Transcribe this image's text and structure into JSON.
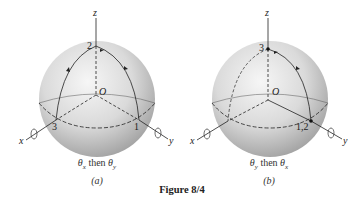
{
  "figure": {
    "title": "Figure 8/4",
    "panels": [
      {
        "id": "a",
        "tag": "(a)",
        "caption": "θx then θy",
        "caption_parts": {
          "t1": "θ",
          "s1": "x",
          "mid": " then ",
          "t2": "θ",
          "s2": "y"
        },
        "axes": {
          "x": "x",
          "y": "y",
          "z": "z"
        },
        "origin": "O",
        "points": {
          "top": "2",
          "left": "3",
          "right": "1"
        }
      },
      {
        "id": "b",
        "tag": "(b)",
        "caption": "θy then θx",
        "caption_parts": {
          "t1": "θ",
          "s1": "y",
          "mid": " then ",
          "t2": "θ",
          "s2": "x"
        },
        "axes": {
          "x": "x",
          "y": "y",
          "z": "z"
        },
        "origin": "O",
        "points": {
          "top": "3",
          "right": "1,2"
        }
      }
    ]
  },
  "colors": {
    "ink": "#222222",
    "sphere_light": "#f4f4f4",
    "sphere_dark": "#a8a8a8"
  }
}
